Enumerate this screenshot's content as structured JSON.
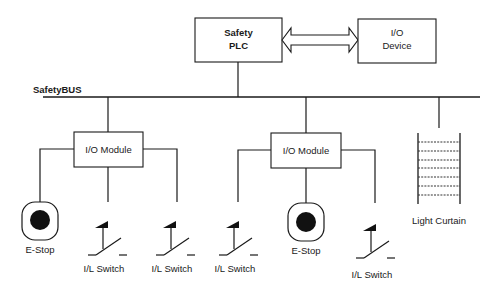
{
  "diagram": {
    "type": "safety network topology",
    "bus": {
      "label": "SafetyBUS"
    },
    "controller": {
      "line1": "Safety",
      "line2": "PLC"
    },
    "io_device": {
      "line1": "I/O",
      "line2": "Device"
    },
    "link": {
      "kind": "bidirectional-arrow",
      "from": "Safety PLC",
      "to": "I/O Device"
    },
    "modules": [
      {
        "label": "I/O Module",
        "devices": [
          {
            "type": "estop",
            "label": "E-Stop"
          },
          {
            "type": "interlock-switch",
            "label": "I/L Switch"
          },
          {
            "type": "interlock-switch",
            "label": "I/L Switch"
          }
        ]
      },
      {
        "label": "I/O Module",
        "devices": [
          {
            "type": "interlock-switch",
            "label": "I/L Switch"
          },
          {
            "type": "estop",
            "label": "E-Stop"
          },
          {
            "type": "interlock-switch",
            "label": "I/L Switch"
          }
        ]
      }
    ],
    "light_curtain": {
      "label": "Light Curtain",
      "beams": 7
    },
    "colors": {
      "line": "#1a1a1a",
      "background": "#ffffff"
    }
  }
}
